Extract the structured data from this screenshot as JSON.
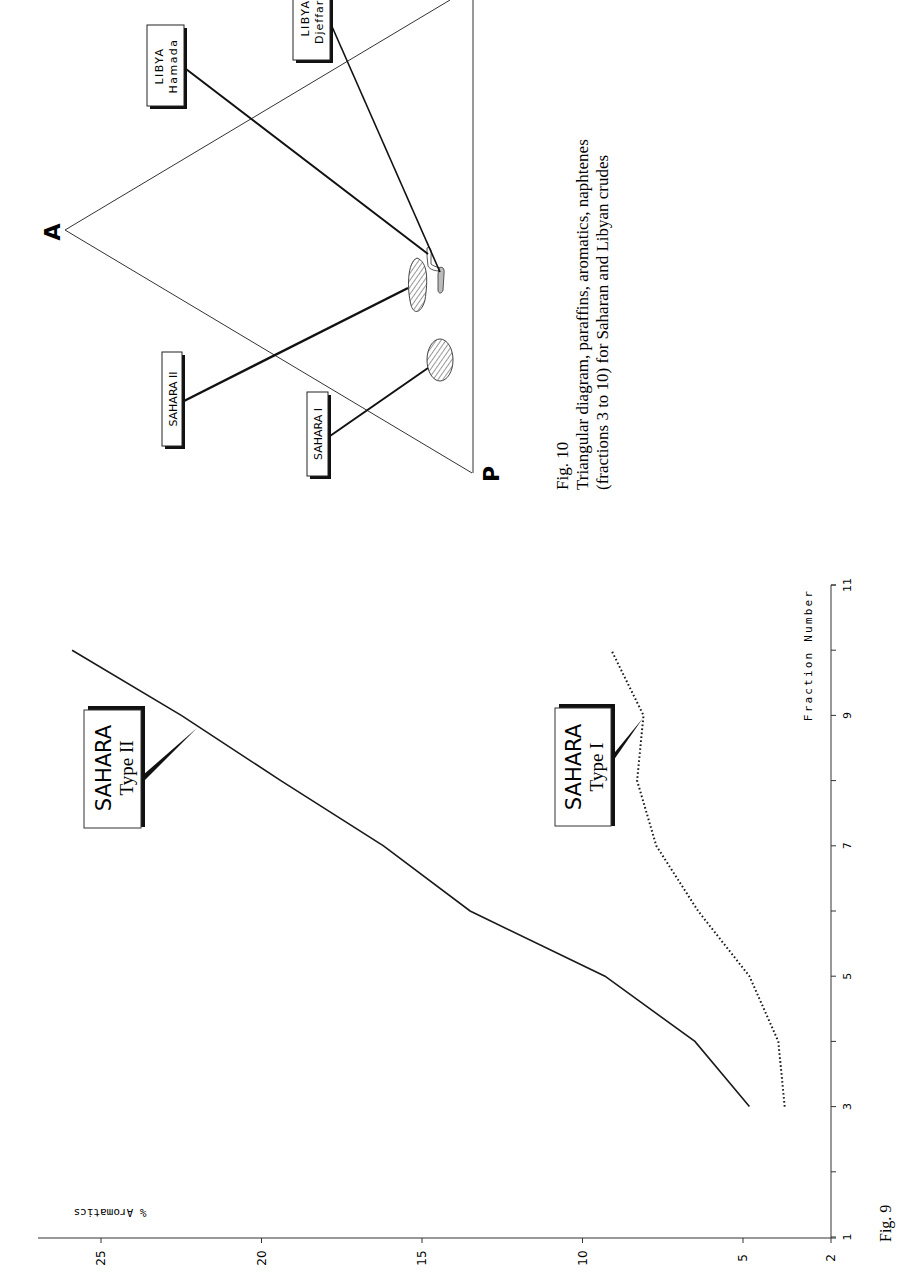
{
  "figure9": {
    "caption": "Fig. 9",
    "y_axis_label": "% Aromatics",
    "x_axis_label": "Fraction Number",
    "labels": {
      "type2_line1": "SAHARA",
      "type2_line2": "Type II",
      "type1_line1": "SAHARA",
      "type1_line2": "Type I"
    }
  },
  "figure10": {
    "caption_title": "Fig. 10",
    "caption_line1": "Triangular diagram, paraffins, aromatics, naphtenes",
    "caption_line2": "(fractions 3 to 10) for Saharan and Libyan crudes",
    "vertex_a": "A",
    "vertex_p": "P",
    "labels": {
      "sahara1": "SAHARA I",
      "sahara2": "SAHARA II",
      "hamada_line1": "LIBYA",
      "hamada_line2": "Hamada",
      "djeffara_line1": "LIBYA",
      "djeffara_line2": "Djeffara"
    }
  },
  "chart_data": [
    {
      "type": "line",
      "title": "Fig. 9",
      "xlabel": "Fraction Number",
      "ylabel": "% Aromatics",
      "xlim": [
        1,
        11
      ],
      "ylim": [
        2,
        26
      ],
      "x_ticks": [
        1,
        3,
        5,
        7,
        9,
        11
      ],
      "y_ticks": [
        2,
        5,
        10,
        15,
        20,
        25
      ],
      "grid": false,
      "orientation_note": "figure printed rotated 90 degrees",
      "x": [
        3,
        4,
        5,
        6,
        7,
        8,
        9,
        10
      ],
      "series": [
        {
          "name": "SAHARA Type II",
          "style": "solid",
          "values": [
            4.8,
            6.5,
            9.3,
            13.5,
            16.2,
            19.4,
            22.5,
            25.9
          ]
        },
        {
          "name": "SAHARA Type I",
          "style": "dotted",
          "values": [
            3.7,
            3.9,
            4.8,
            6.4,
            7.7,
            8.3,
            8.1,
            9.1
          ]
        }
      ]
    },
    {
      "type": "ternary",
      "title": "Fig. 10",
      "vertices": [
        "A",
        "P",
        "N"
      ],
      "regions": [
        {
          "name": "SAHARA I",
          "shape": "hatched ellipse"
        },
        {
          "name": "SAHARA II",
          "shape": "hatched teardrop"
        },
        {
          "name": "LIBYA Hamada",
          "shape": "thin hook"
        },
        {
          "name": "LIBYA Djeffara",
          "shape": "small elongated shaded"
        }
      ]
    }
  ]
}
